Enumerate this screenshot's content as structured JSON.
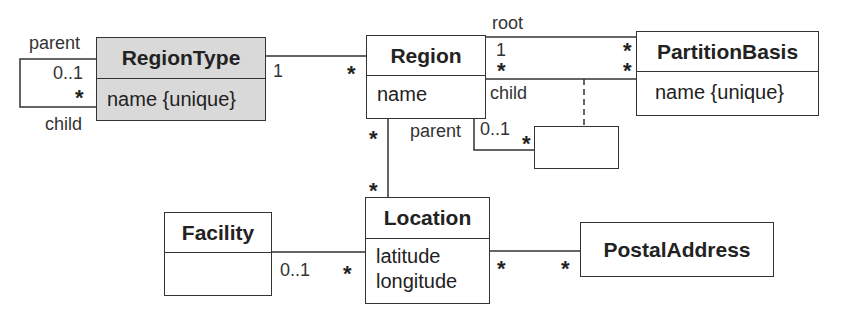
{
  "classes": {
    "region_type": {
      "name": "RegionType",
      "attributes": [
        "name {unique}"
      ],
      "fill": "#d9d9d9"
    },
    "region": {
      "name": "Region",
      "attributes": [
        "name"
      ]
    },
    "partition_basis": {
      "name": "PartitionBasis",
      "attributes": [
        "name {unique}"
      ]
    },
    "association_class": {
      "name": "",
      "attributes": []
    },
    "location": {
      "name": "Location",
      "attributes": [
        "latitude",
        "longitude"
      ]
    },
    "facility": {
      "name": "Facility",
      "attributes": []
    },
    "postal_address": {
      "name": "PostalAddress",
      "attributes": []
    }
  },
  "associations": {
    "regiontype_self": {
      "parent_role": "parent",
      "parent_mult": "0..1",
      "child_role": "child",
      "child_mult": "*"
    },
    "regiontype_region": {
      "regiontype_mult": "1",
      "region_mult": "*"
    },
    "region_partition_root": {
      "role": "root",
      "region_mult": "1",
      "partition_mult": "*"
    },
    "region_partition_child": {
      "role": "child",
      "region_mult": "*",
      "partition_mult": "*"
    },
    "region_self_parent": {
      "role": "parent",
      "mult": "0..1",
      "assoc_mult": "*"
    },
    "region_location": {
      "region_mult": "*",
      "location_mult": "*"
    },
    "facility_location": {
      "facility_mult": "0..1",
      "location_mult": "*"
    },
    "location_postal": {
      "location_mult": "*",
      "postal_mult": "*"
    }
  }
}
